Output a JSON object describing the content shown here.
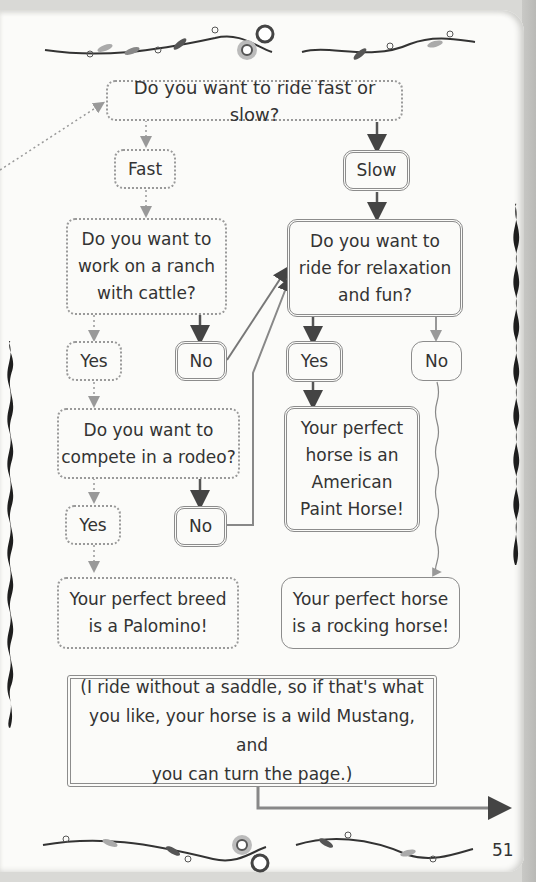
{
  "flowchart": {
    "start": {
      "text": "Do you want to ride fast or slow?"
    },
    "fast": {
      "text": "Fast"
    },
    "slow": {
      "text": "Slow"
    },
    "ranch_q": {
      "text": "Do you want to\nwork on a ranch\nwith cattle?"
    },
    "relax_q": {
      "text": "Do you want to\nride for relaxation\nand fun?"
    },
    "ranch_yes": {
      "text": "Yes"
    },
    "ranch_no": {
      "text": "No"
    },
    "relax_yes": {
      "text": "Yes"
    },
    "relax_no": {
      "text": "No"
    },
    "rodeo_q": {
      "text": "Do you want to\ncompete in a rodeo?"
    },
    "rodeo_yes": {
      "text": "Yes"
    },
    "rodeo_no": {
      "text": "No"
    },
    "result_paint": {
      "text": "Your perfect\nhorse is an\nAmerican\nPaint Horse!"
    },
    "result_palomino": {
      "text": "Your perfect breed\nis a Palomino!"
    },
    "result_rocking": {
      "text": "Your perfect horse\nis a rocking horse!"
    },
    "note": {
      "text": "(I ride without a saddle, so if that's what\nyou like, your horse is a wild Mustang, and\nyou can turn the page.)"
    }
  },
  "page": {
    "number": "51"
  },
  "colors": {
    "line_dark": "#555555",
    "line_light": "#9a9a9a",
    "paper": "#fbfbf9"
  }
}
